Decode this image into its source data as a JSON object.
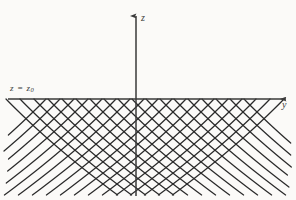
{
  "figure": {
    "background_color": "#fbfaf8",
    "ink_color": "#2b2b2b",
    "width": 296,
    "height": 200
  },
  "axes": {
    "vertical": {
      "name": "z-axis",
      "label": "z",
      "x": 136,
      "top": 14,
      "bottom": 196,
      "arrow": "up"
    },
    "horizontal": {
      "name": "y-axis",
      "label": "y",
      "y": 99,
      "left": 8,
      "right": 288,
      "arrow": "right"
    },
    "origin": {
      "x": 136,
      "y": 99
    }
  },
  "annotations": {
    "initial_line": {
      "label_text": "z = z",
      "label_subscript": "0",
      "full_label": "z = z0",
      "description": "initial data line coinciding with the horizontal axis"
    }
  },
  "chart_data": {
    "type": "line",
    "xlabel": "y",
    "ylabel": "z",
    "grid": false,
    "legend": null,
    "origin_px": {
      "x": 136,
      "y": 99
    },
    "families": [
      {
        "name": "family-a",
        "direction": "down-right",
        "count": 15,
        "start_y_px": [
          -62,
          -44,
          -26,
          -8,
          10,
          28,
          46,
          64,
          82,
          100,
          118,
          136,
          154,
          172,
          190
        ],
        "curvature": 0.16,
        "slope": 1.0,
        "length_px": 150
      },
      {
        "name": "family-b",
        "direction": "down-left",
        "count": 15,
        "start_y_px": [
          82,
          100,
          118,
          136,
          154,
          172,
          190,
          208,
          226,
          244,
          262,
          280,
          298,
          316,
          334
        ],
        "curvature": -0.16,
        "slope": -1.0,
        "length_px": 150
      }
    ],
    "cusp_points_px": [
      34,
      48,
      62,
      76,
      90,
      104,
      118,
      132,
      146,
      160,
      174,
      188,
      202,
      216,
      230
    ]
  }
}
